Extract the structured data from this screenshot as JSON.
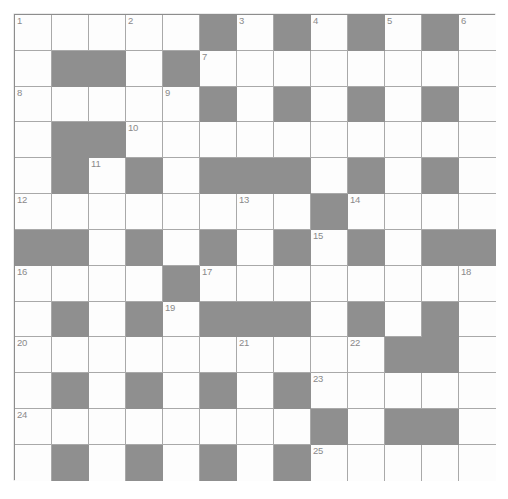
{
  "puzzle": {
    "title": "Crossword Grid",
    "rows": 13,
    "cols": 13,
    "cell_size_px": 37,
    "colors": {
      "white_cell": "#fdfdfd",
      "black_cell": "#8f8f8f",
      "grid_line": "#a9a9a9",
      "border": "#8d8d8d",
      "number_text": "#8a8a8a",
      "page_background": "#ffffff"
    },
    "legend": {
      "white": "open letter square",
      "black": "blocked square"
    },
    "grid": [
      [
        "W",
        "W",
        "W",
        "W",
        "W",
        "B",
        "W",
        "B",
        "W",
        "B",
        "W",
        "B",
        "W"
      ],
      [
        "W",
        "B",
        "B",
        "W",
        "B",
        "W",
        "W",
        "W",
        "W",
        "W",
        "W",
        "W",
        "W"
      ],
      [
        "W",
        "W",
        "W",
        "W",
        "W",
        "B",
        "W",
        "B",
        "W",
        "B",
        "W",
        "B",
        "W"
      ],
      [
        "W",
        "B",
        "B",
        "W",
        "W",
        "W",
        "W",
        "W",
        "W",
        "W",
        "W",
        "W",
        "W"
      ],
      [
        "W",
        "B",
        "W",
        "B",
        "W",
        "B",
        "B",
        "B",
        "W",
        "B",
        "W",
        "B",
        "W"
      ],
      [
        "W",
        "W",
        "W",
        "W",
        "W",
        "W",
        "W",
        "W",
        "B",
        "W",
        "W",
        "W",
        "W"
      ],
      [
        "B",
        "B",
        "W",
        "B",
        "W",
        "B",
        "W",
        "B",
        "W",
        "B",
        "W",
        "B",
        "B"
      ],
      [
        "W",
        "W",
        "W",
        "W",
        "B",
        "W",
        "W",
        "W",
        "W",
        "W",
        "W",
        "W",
        "W"
      ],
      [
        "W",
        "B",
        "W",
        "B",
        "W",
        "B",
        "B",
        "B",
        "W",
        "B",
        "W",
        "B",
        "W"
      ],
      [
        "W",
        "W",
        "W",
        "W",
        "W",
        "W",
        "W",
        "W",
        "W",
        "W",
        "B",
        "B",
        "W"
      ],
      [
        "W",
        "B",
        "W",
        "B",
        "W",
        "B",
        "W",
        "B",
        "W",
        "W",
        "W",
        "W",
        "W"
      ],
      [
        "W",
        "W",
        "W",
        "W",
        "W",
        "W",
        "W",
        "W",
        "B",
        "W",
        "B",
        "B",
        "W"
      ],
      [
        "W",
        "B",
        "W",
        "B",
        "W",
        "B",
        "W",
        "B",
        "W",
        "W",
        "W",
        "W",
        "W"
      ]
    ],
    "numbers": [
      {
        "n": "1",
        "row": 1,
        "col": 1
      },
      {
        "n": "2",
        "row": 1,
        "col": 4
      },
      {
        "n": "3",
        "row": 1,
        "col": 7
      },
      {
        "n": "4",
        "row": 1,
        "col": 9
      },
      {
        "n": "5",
        "row": 1,
        "col": 11
      },
      {
        "n": "6",
        "row": 1,
        "col": 13
      },
      {
        "n": "7",
        "row": 2,
        "col": 6
      },
      {
        "n": "8",
        "row": 3,
        "col": 1
      },
      {
        "n": "9",
        "row": 3,
        "col": 5
      },
      {
        "n": "10",
        "row": 4,
        "col": 4
      },
      {
        "n": "11",
        "row": 5,
        "col": 3
      },
      {
        "n": "12",
        "row": 6,
        "col": 1
      },
      {
        "n": "13",
        "row": 6,
        "col": 7
      },
      {
        "n": "14",
        "row": 6,
        "col": 10
      },
      {
        "n": "15",
        "row": 7,
        "col": 9
      },
      {
        "n": "16",
        "row": 8,
        "col": 1
      },
      {
        "n": "17",
        "row": 8,
        "col": 6
      },
      {
        "n": "18",
        "row": 8,
        "col": 13
      },
      {
        "n": "19",
        "row": 9,
        "col": 5
      },
      {
        "n": "20",
        "row": 10,
        "col": 1
      },
      {
        "n": "21",
        "row": 10,
        "col": 7
      },
      {
        "n": "22",
        "row": 10,
        "col": 10
      },
      {
        "n": "23",
        "row": 11,
        "col": 9
      },
      {
        "n": "24",
        "row": 12,
        "col": 1
      },
      {
        "n": "25",
        "row": 13,
        "col": 9
      }
    ],
    "entries": []
  }
}
